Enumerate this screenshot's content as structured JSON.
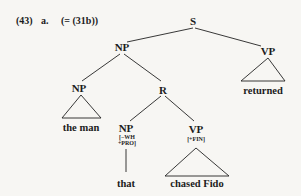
{
  "example": {
    "number": "(43)",
    "sub": "a.",
    "reference": "(= (31b))"
  },
  "tree": {
    "root": "S",
    "nodes": {
      "s": "S",
      "np_subject": "NP",
      "vp_main": "VP",
      "np_head": "NP",
      "r": "R",
      "np_rel": "NP",
      "np_rel_features": [
        "[−WH",
        "+PRO]"
      ],
      "vp_rel": "VP",
      "vp_rel_features": "[+FIN]"
    },
    "leaves": {
      "vp_main": "returned",
      "np_head": "the man",
      "np_rel": "that",
      "vp_rel": "chased Fido"
    },
    "structure": [
      {
        "parent": "S",
        "children": [
          "NP",
          "VP"
        ]
      },
      {
        "parent": "NP",
        "children": [
          "NP",
          "R"
        ]
      },
      {
        "parent": "NP (head)",
        "children": [
          "the man"
        ],
        "abbreviated": true
      },
      {
        "parent": "R",
        "children": [
          "NP [-WH, +PRO]",
          "VP [+FIN]"
        ]
      },
      {
        "parent": "NP [-WH, +PRO]",
        "children": [
          "that"
        ],
        "abbreviated": false
      },
      {
        "parent": "VP [+FIN]",
        "children": [
          "chased Fido"
        ],
        "abbreviated": true
      },
      {
        "parent": "VP (main)",
        "children": [
          "returned"
        ],
        "abbreviated": true
      }
    ]
  }
}
